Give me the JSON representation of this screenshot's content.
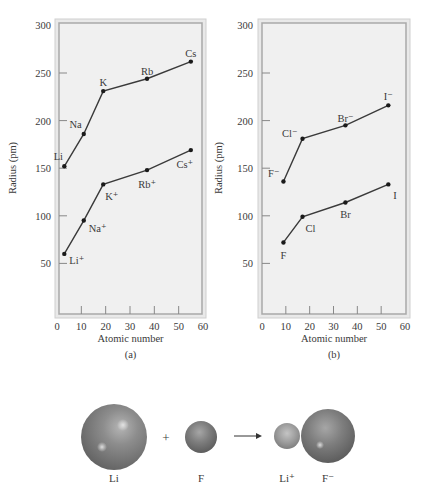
{
  "chart_data": [
    {
      "type": "line",
      "panel_label": "(a)",
      "title": "",
      "xlabel": "Atomic number",
      "ylabel": "Radius (pm)",
      "xlim": [
        0,
        60
      ],
      "ylim": [
        0,
        300
      ],
      "x_ticks": [
        0,
        10,
        20,
        30,
        40,
        50,
        60
      ],
      "y_ticks": [
        50,
        100,
        150,
        200,
        250,
        300
      ],
      "grid": false,
      "series": [
        {
          "name": "Alkali metal atoms",
          "labels": [
            "Li",
            "Na",
            "K",
            "Rb",
            "Cs"
          ],
          "x": [
            3,
            11,
            19,
            37,
            55
          ],
          "values": [
            152,
            186,
            231,
            244,
            262
          ]
        },
        {
          "name": "Alkali metal cations",
          "labels": [
            "Li⁺",
            "Na⁺",
            "K⁺",
            "Rb⁺",
            "Cs⁺"
          ],
          "x": [
            3,
            11,
            19,
            37,
            55
          ],
          "values": [
            60,
            95,
            133,
            148,
            169
          ]
        }
      ]
    },
    {
      "type": "line",
      "panel_label": "(b)",
      "title": "",
      "xlabel": "Atomic number",
      "ylabel": "Radius (pm)",
      "xlim": [
        0,
        60
      ],
      "ylim": [
        0,
        300
      ],
      "x_ticks": [
        0,
        10,
        20,
        30,
        40,
        50,
        60
      ],
      "y_ticks": [
        50,
        100,
        150,
        200,
        250,
        300
      ],
      "grid": false,
      "series": [
        {
          "name": "Halide anions",
          "labels": [
            "F⁻",
            "Cl⁻",
            "Br⁻",
            "I⁻"
          ],
          "x": [
            9,
            17,
            35,
            53
          ],
          "values": [
            136,
            181,
            195,
            216
          ]
        },
        {
          "name": "Halogen atoms",
          "labels": [
            "F",
            "Cl",
            "Br",
            "I"
          ],
          "x": [
            9,
            17,
            35,
            53
          ],
          "values": [
            72,
            99,
            114,
            133
          ]
        }
      ]
    }
  ],
  "reaction": {
    "plus": "+",
    "arrow": "⟶",
    "species": [
      {
        "label": "Li",
        "role": "reactant"
      },
      {
        "label": "F",
        "role": "reactant"
      },
      {
        "label": "Li⁺",
        "role": "product"
      },
      {
        "label": "F⁻",
        "role": "product"
      }
    ]
  }
}
